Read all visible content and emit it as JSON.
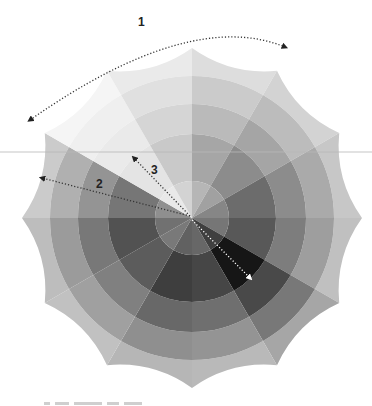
{
  "diagram": {
    "type": "segmented-color-wheel (grayscale)",
    "center": [
      192,
      218
    ],
    "segments": 12,
    "segment_angle_deg": 30,
    "ring_radii": [
      37,
      84,
      114,
      142
    ],
    "outer_star_radius": 170,
    "outer_valley_radius": 156,
    "segment_base_shades": [
      "#a6a6a6",
      "#8c8c8c",
      "#6c6c6c",
      "#585858",
      "#161616",
      "#464646",
      "#3e3e3e",
      "#5c5c5c",
      "#525252",
      "#767676",
      "#e4e4e4",
      "#c9c9c9"
    ],
    "ring_lighten": [
      0.18,
      0.0,
      0.22,
      0.42,
      0.62
    ],
    "annotations": [
      {
        "id": "1",
        "label": "1",
        "kind": "curved dotted double arrow",
        "from": [
          30,
          120
        ],
        "via": [
          190,
          8
        ],
        "to": [
          285,
          47
        ],
        "label_pos": [
          138,
          26
        ],
        "color": "#333333"
      },
      {
        "id": "2",
        "label": "2",
        "kind": "dotted arrow from center",
        "from": [
          190,
          216
        ],
        "to": [
          42,
          178
        ],
        "label_pos": [
          96,
          188
        ],
        "color": "#333333"
      },
      {
        "id": "3",
        "label": "3",
        "kind": "dotted arrow from center",
        "from": [
          190,
          216
        ],
        "to": [
          134,
          158
        ],
        "label_pos": [
          151,
          174
        ],
        "color": "#333333"
      },
      {
        "id": "4",
        "label": "",
        "kind": "white dotted arrow from center",
        "from": [
          192,
          220
        ],
        "to": [
          250,
          278
        ],
        "color": "#ffffff"
      }
    ],
    "guide_line_y": 152,
    "guide_line_color": "#b8b8b8"
  },
  "footer": {
    "caption_visible": "cut-off caption text (illegible)"
  }
}
